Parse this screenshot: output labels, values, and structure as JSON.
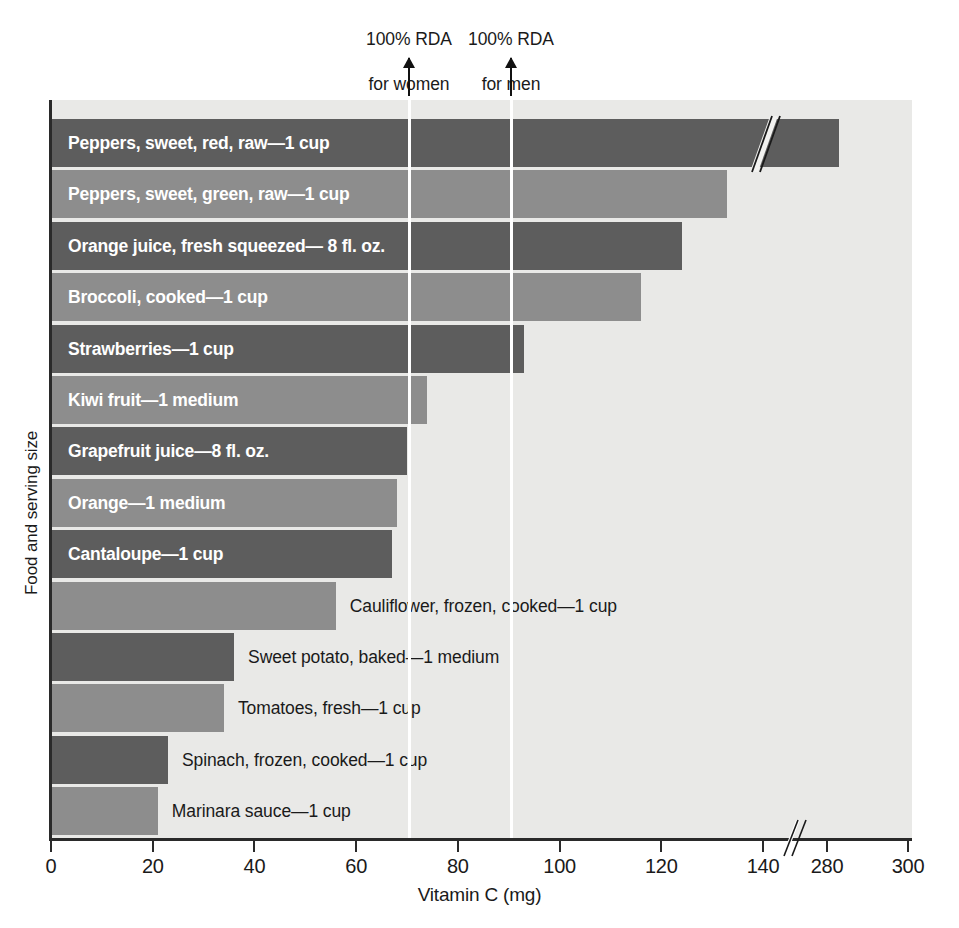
{
  "chart_data": {
    "type": "bar",
    "orientation": "horizontal",
    "title": "",
    "xlabel": "Vitamin C (mg)",
    "ylabel": "Food and serving size",
    "xlim": [
      0,
      300
    ],
    "grid": false,
    "legend": null,
    "axis_break": {
      "present": true,
      "from": 140,
      "to": 280
    },
    "xticks": [
      0,
      20,
      40,
      60,
      80,
      100,
      120,
      140,
      280,
      300
    ],
    "xtick_labels": [
      "0",
      "20",
      "40",
      "60",
      "80",
      "100",
      "120",
      "140",
      "280",
      "300"
    ],
    "categories": [
      "Peppers, sweet, red, raw—1 cup",
      "Peppers, sweet, green, raw—1 cup",
      "Orange juice, fresh squeezed— 8 fl. oz.",
      "Broccoli, cooked—1 cup",
      "Strawberries—1 cup",
      "Kiwi fruit—1 medium",
      "Grapefruit juice—8 fl. oz.",
      "Orange—1 medium",
      "Cantaloupe—1 cup",
      "Cauliflower, frozen, cooked—1 cup",
      "Sweet potato, baked—1 medium",
      "Tomatoes, fresh—1 cup",
      "Spinach, frozen, cooked—1 cup",
      "Marinara sauce—1 cup"
    ],
    "values": [
      283,
      133,
      124,
      116,
      93,
      74,
      70,
      68,
      67,
      56,
      36,
      34,
      23,
      21
    ],
    "annotations": [
      {
        "name": "rda-women",
        "label": "100% RDA\nfor women",
        "value": 70
      },
      {
        "name": "rda-men",
        "label": "100% RDA\nfor men",
        "value": 90
      }
    ],
    "colors": {
      "bar_dark": "#5d5d5d",
      "bar_light": "#8d8d8d",
      "plot_background": "#e9e9e7",
      "rda_line": "#ffffff",
      "axis": "#2a2a2a",
      "label_inside": "#ffffff",
      "label_outside": "#1a1a1a"
    }
  },
  "annotations": {
    "women": {
      "line1": "100% RDA",
      "line2": "for women"
    },
    "men": {
      "line1": "100% RDA",
      "line2": "for men"
    }
  },
  "axes": {
    "x_title": "Vitamin C (mg)",
    "y_title": "Food and serving size"
  }
}
